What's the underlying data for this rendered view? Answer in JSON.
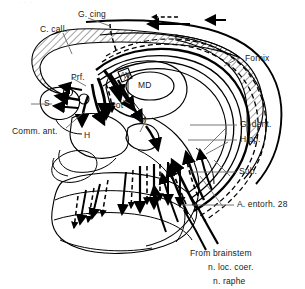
{
  "figure": {
    "kind": "anatomical-diagram",
    "background_color": "#ffffff",
    "ink_color": "#000000",
    "hatch_color": "#555555"
  },
  "labels": {
    "g_cing": "G. cing",
    "c_call": "C. call.",
    "fornix": "Fornix",
    "prf": "Prf.",
    "av": "AV",
    "md": "MD",
    "pot": "Pot",
    "s": "S",
    "m": "M",
    "h": "H",
    "comm_ant": "Comm. ant.",
    "g_dent": "G. dent.",
    "hipp": "Hipp.",
    "sub": "Sub.",
    "a_entorh": "A. entorh. 28",
    "from_brainstem": "From  brainstem",
    "n_loc_coer": "n. loc. coer.",
    "n_raphe": "n. raphe"
  },
  "legend_notes": {
    "solid_arrow": "efferent pathway",
    "dashed_arrow": "afferent / modulatory pathway"
  }
}
